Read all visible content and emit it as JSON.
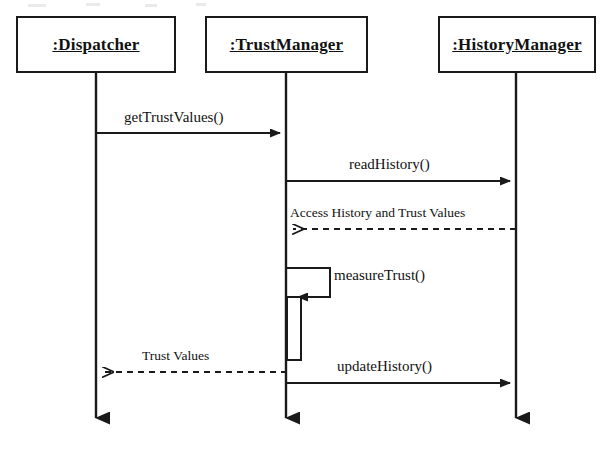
{
  "diagram": {
    "type": "uml-sequence-diagram",
    "title": "",
    "stroke_color": "#1a1a1a",
    "background_color": "#ffffff",
    "participants": [
      {
        "id": "dispatcher",
        "label": ":Dispatcher",
        "box": {
          "x": 16,
          "y": 16,
          "width": 160,
          "height": 57
        },
        "lifeline_x": 96,
        "lifeline_top": 73,
        "lifeline_bottom": 432
      },
      {
        "id": "trustmanager",
        "label": ":TrustManager",
        "box": {
          "x": 205,
          "y": 16,
          "width": 163,
          "height": 57
        },
        "lifeline_x": 286,
        "lifeline_top": 73,
        "lifeline_bottom": 432
      },
      {
        "id": "historymanager",
        "label": ":HistoryManager",
        "box": {
          "x": 438,
          "y": 16,
          "width": 158,
          "height": 57
        },
        "lifeline_x": 516,
        "lifeline_top": 73,
        "lifeline_bottom": 432
      }
    ],
    "messages": [
      {
        "id": "msg-get-trust-values",
        "label": "getTrustValues()",
        "kind": "call",
        "line_style": "solid",
        "arrow_style": "filled",
        "from": "dispatcher",
        "to": "trustmanager",
        "direction": "right",
        "y": 133,
        "label_x": 124,
        "label_y": 120
      },
      {
        "id": "msg-read-history",
        "label": "readHistory()",
        "kind": "call",
        "line_style": "solid",
        "arrow_style": "filled",
        "from": "trustmanager",
        "to": "historymanager",
        "direction": "right",
        "y": 181,
        "label_x": 349,
        "label_y": 167
      },
      {
        "id": "msg-access-history-and-trust-values",
        "label": "Access History and Trust Values",
        "kind": "return",
        "line_style": "dashed",
        "arrow_style": "open",
        "from": "historymanager",
        "to": "trustmanager",
        "direction": "left",
        "y": 229,
        "label_x": 290,
        "label_y": 215
      },
      {
        "id": "msg-measure-trust",
        "label": "measureTrust()",
        "kind": "self-call",
        "line_style": "solid",
        "arrow_style": "filled",
        "from": "trustmanager",
        "to": "trustmanager",
        "direction": "self",
        "y": 268,
        "loop_right_x": 330,
        "loop_return_y": 297,
        "label_x": 334,
        "label_y": 276
      },
      {
        "id": "msg-trust-values",
        "label": "Trust Values",
        "kind": "return",
        "line_style": "dashed",
        "arrow_style": "open",
        "from": "trustmanager",
        "to": "dispatcher",
        "direction": "left",
        "y": 372,
        "label_x": 142,
        "label_y": 358
      },
      {
        "id": "msg-update-history",
        "label": "updateHistory()",
        "kind": "call",
        "line_style": "solid",
        "arrow_style": "filled",
        "from": "trustmanager",
        "to": "historymanager",
        "direction": "right",
        "y": 383,
        "label_x": 337,
        "label_y": 369
      }
    ],
    "activations": [
      {
        "id": "activation-trustmanager-measure",
        "participant": "trustmanager",
        "x": 287,
        "y": 297,
        "width": 14,
        "height": 63
      }
    ]
  }
}
